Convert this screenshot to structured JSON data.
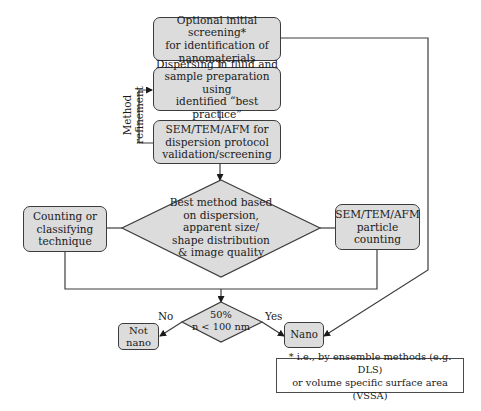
{
  "diagram": {
    "nodes": {
      "initial_screening": "Optional initial screening*\nfor identification of\nnanomaterials",
      "dispersing": "Dispersing in fluid and\nsample preparation using\nidentified “best practice”",
      "validation": "SEM/TEM/AFM for\ndispersion protocol\nvalidation/screening",
      "best_method": "Best method based\non dispersion,\napparent size/\nshape distribution\n& image quality",
      "counting_technique": "Counting or\nclassifying\ntechnique",
      "particle_counting": "SEM/TEM/AFM\nparticle counting",
      "threshold": "50%\nn < 100 nm",
      "not_nano": "Not\nnano",
      "nano": "Nano"
    },
    "edge_labels": {
      "method_refinement": "Method\nrefinement",
      "no": "No",
      "yes": "Yes"
    },
    "footnote": "* i.e., by ensemble methods (e.g. DLS)\nor volume specific surface area (VSSA)",
    "colors": {
      "box_fill": "#dcdcdc",
      "line": "#3c3c3c"
    }
  }
}
